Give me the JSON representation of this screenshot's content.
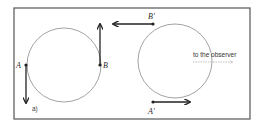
{
  "figure": {
    "panel_label": "a)",
    "frame": {
      "x": 14,
      "y": 8,
      "width": 236,
      "height": 111,
      "color": "#555555"
    },
    "colors": {
      "circle_stroke": "#8a8a8a",
      "arrow": "#222222",
      "point": "#222222",
      "observer_arrow": "#b0b0b0"
    },
    "left_circle": {
      "cx": 64,
      "cy": 65,
      "r": 37,
      "points": {
        "A": {
          "label": "A",
          "x": 27,
          "y": 65,
          "arrow_direction": "down"
        },
        "B": {
          "label": "B",
          "x": 101,
          "y": 65,
          "arrow_direction": "up"
        }
      }
    },
    "right_circle": {
      "cx": 175,
      "cy": 61,
      "r": 37,
      "points": {
        "B_prime": {
          "label": "B′",
          "x": 153,
          "y": 24,
          "arrow_direction": "left"
        },
        "A_prime": {
          "label": "A′",
          "x": 153,
          "y": 102,
          "arrow_direction": "right"
        }
      }
    },
    "observer": {
      "text": "to the observer",
      "arrow_direction": "right",
      "arrow_style": "dotted"
    }
  }
}
